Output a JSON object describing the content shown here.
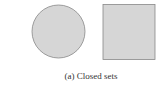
{
  "figure": {
    "caption": "(a) Closed sets",
    "shapes": [
      {
        "type": "circle",
        "label": "closed-disk",
        "fill": "#d6d6d6",
        "stroke": "#888888"
      },
      {
        "type": "square",
        "label": "closed-square",
        "fill": "#d6d6d6",
        "stroke": "#888888"
      }
    ]
  }
}
